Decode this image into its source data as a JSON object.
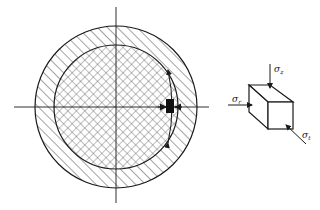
{
  "figure": {
    "cross_section": {
      "center": [
        116,
        107
      ],
      "outer_radius": 81,
      "inner_radius": 62,
      "outer_ring_fill": "diagonal-hatch",
      "inner_core_fill": "cross-hatch",
      "element_marker": "black-rectangle"
    },
    "stress_element": {
      "labels": {
        "top": {
          "symbol": "σ",
          "subscript": "z"
        },
        "left": {
          "symbol": "σ",
          "subscript": "r"
        },
        "bottom_right": {
          "symbol": "σ",
          "subscript": "t"
        }
      }
    },
    "colors": {
      "stroke": "#1a1a1a",
      "background": "#ffffff"
    }
  }
}
